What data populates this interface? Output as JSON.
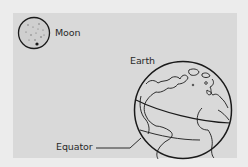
{
  "diagram": {
    "labels": {
      "moon": "Moon",
      "earth": "Earth",
      "equator": "Equator"
    },
    "colors": {
      "outer_background": "#ececec",
      "panel_background": "#d9d9d9",
      "line": "#1a1a1a",
      "moon_fill": "#cfcfcf"
    },
    "objects": [
      {
        "name": "Moon",
        "shape": "circle",
        "relative_size": "small"
      },
      {
        "name": "Earth",
        "shape": "globe",
        "relative_size": "large",
        "features": [
          "continents",
          "equator-line"
        ]
      }
    ]
  }
}
